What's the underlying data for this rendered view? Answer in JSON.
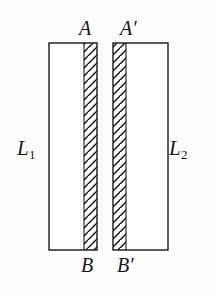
{
  "figure": {
    "background_color": "#fdfdfd",
    "stroke_color": "#18181a",
    "labels": {
      "top_left": "A",
      "top_right_base": "A",
      "top_right_prime": "′",
      "bottom_left": "B",
      "bottom_right_base": "B",
      "bottom_right_prime": "′",
      "left_side_base": "L",
      "left_side_sub": "1",
      "right_side_base": "L",
      "right_side_sub": "2"
    },
    "shapes": {
      "left_slab": {
        "name": "L1",
        "x": 49,
        "y": 43,
        "width": 48,
        "height": 207,
        "hatch_side": "right",
        "hatch_band_width": 13
      },
      "right_slab": {
        "name": "L2",
        "x": 113,
        "y": 43,
        "width": 55,
        "height": 207,
        "hatch_side": "left",
        "hatch_band_width": 13
      },
      "gap": {
        "x": 97,
        "width": 16
      },
      "hatch_spacing": 8,
      "hatch_angle_degrees": 40
    }
  }
}
